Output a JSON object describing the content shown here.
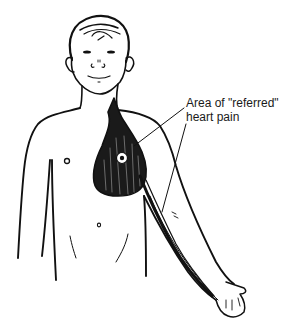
{
  "figure": {
    "annotation": {
      "line1": "Area of \"referred\"",
      "line2": "heart pain"
    },
    "colors": {
      "ink": "#111111",
      "background": "#ffffff"
    }
  }
}
